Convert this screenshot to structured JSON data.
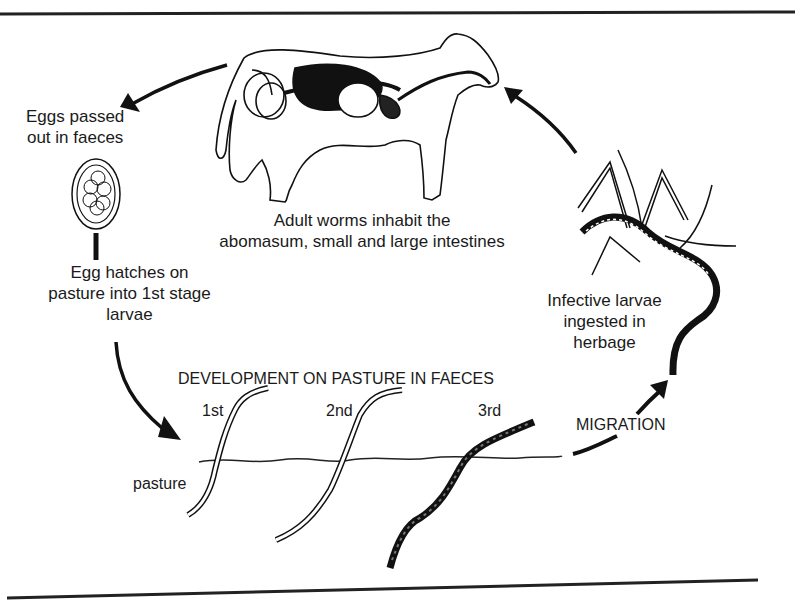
{
  "diagram": {
    "title_fragment": "...y ...g...",
    "type": "life-cycle",
    "labels": {
      "eggs_passed": [
        "Eggs passed",
        "out in faeces"
      ],
      "adult_worms": [
        "Adult worms inhabit the",
        "abomasum, small and large intestines"
      ],
      "egg_hatches": [
        "Egg hatches on",
        "pasture into 1st stage",
        "larvae"
      ],
      "development": "DEVELOPMENT ON PASTURE IN FAECES",
      "stage_1": "1st",
      "stage_2": "2nd",
      "stage_3": "3rd",
      "pasture": "pasture",
      "migration": "MIGRATION",
      "infective": [
        "Infective larvae",
        "ingested in",
        "herbage"
      ]
    },
    "nodes": [
      {
        "id": "cow",
        "label": "Adult worms inhabit the abomasum, small and large intestines"
      },
      {
        "id": "egg",
        "label": "Eggs passed out in faeces"
      },
      {
        "id": "hatch",
        "label": "Egg hatches on pasture into 1st stage larvae"
      },
      {
        "id": "development",
        "label": "DEVELOPMENT ON PASTURE IN FAECES",
        "stages": [
          "1st",
          "2nd",
          "3rd"
        ]
      },
      {
        "id": "migration",
        "label": "MIGRATION"
      },
      {
        "id": "ingestion",
        "label": "Infective larvae ingested in herbage"
      }
    ],
    "edges": [
      {
        "from": "cow",
        "to": "egg"
      },
      {
        "from": "egg",
        "to": "hatch"
      },
      {
        "from": "hatch",
        "to": "development"
      },
      {
        "from": "development",
        "to": "migration"
      },
      {
        "from": "migration",
        "to": "ingestion"
      },
      {
        "from": "ingestion",
        "to": "cow"
      }
    ],
    "colors": {
      "ink": "#1a1a1a",
      "background": "#ffffff"
    }
  }
}
